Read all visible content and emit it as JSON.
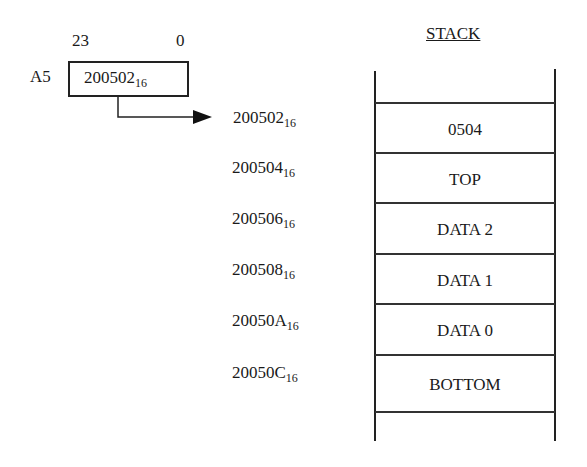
{
  "register": {
    "name": "A5",
    "bit_high": "23",
    "bit_low": "0",
    "value": "200502",
    "base": "16"
  },
  "stack": {
    "title": "STACK",
    "rows": [
      {
        "address": "200502",
        "base": "16",
        "content": "0504"
      },
      {
        "address": "200504",
        "base": "16",
        "content": "TOP"
      },
      {
        "address": "200506",
        "base": "16",
        "content": "DATA 2"
      },
      {
        "address": "200508",
        "base": "16",
        "content": "DATA 1"
      },
      {
        "address": "20050A",
        "base": "16",
        "content": "DATA 0"
      },
      {
        "address": "20050C",
        "base": "16",
        "content": "BOTTOM"
      }
    ]
  }
}
